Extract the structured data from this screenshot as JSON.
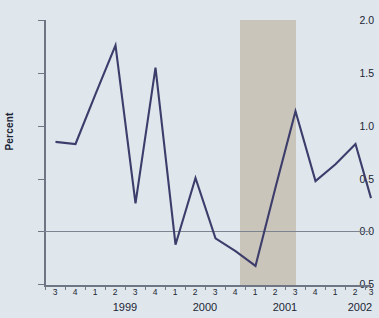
{
  "chart_data": {
    "type": "line",
    "title": "",
    "xlabel": "",
    "ylabel": "Percent",
    "ylim": [
      -0.5,
      2.0
    ],
    "yticks": [
      2.0,
      1.5,
      1.0,
      0.5,
      0.0,
      -0.5
    ],
    "ytick_labels": [
      "2.0",
      "1.5",
      "1.0",
      "0.5",
      "0.0",
      "-0.5"
    ],
    "grid": false,
    "legend": "none",
    "zero_reference_line": 0.0,
    "categories": [
      "1998 Q3",
      "1998 Q4",
      "1999 Q1",
      "1999 Q2",
      "1999 Q3",
      "1999 Q4",
      "2000 Q1",
      "2000 Q2",
      "2000 Q3",
      "2000 Q4",
      "2001 Q1",
      "2001 Q2",
      "2001 Q3",
      "2001 Q4",
      "2002 Q1",
      "2002 Q2",
      "2002 Q3"
    ],
    "quarter_tick_labels": [
      "3",
      "4",
      "1",
      "2",
      "3",
      "4",
      "1",
      "2",
      "3",
      "4",
      "1",
      "2",
      "3",
      "4",
      "1",
      "2",
      "3"
    ],
    "year_labels": [
      "1999",
      "2000",
      "2001",
      "2002"
    ],
    "values": [
      0.85,
      0.83,
      1.3,
      1.76,
      0.27,
      1.55,
      -0.12,
      0.51,
      -0.06,
      -0.18,
      -0.32,
      0.42,
      1.14,
      0.48,
      0.64,
      0.83,
      0.32
    ],
    "series": [
      {
        "name": "Percent change",
        "color": "#3d3d6b",
        "values": [
          0.85,
          0.83,
          1.3,
          1.76,
          0.27,
          1.55,
          -0.12,
          0.51,
          -0.06,
          -0.18,
          -0.32,
          0.42,
          1.14,
          0.48,
          0.64,
          0.83,
          0.32
        ]
      }
    ],
    "shaded_regions": [
      {
        "label": "recession",
        "start_category": "2001 Q1",
        "end_category": "2001 Q4",
        "color": "#c9c5bb"
      }
    ],
    "colors": {
      "background": "#dfe7ed",
      "line": "#3d3d6b",
      "axis": "#6f7683",
      "shading": "#c9c5bb",
      "text": "#1d2433"
    }
  }
}
